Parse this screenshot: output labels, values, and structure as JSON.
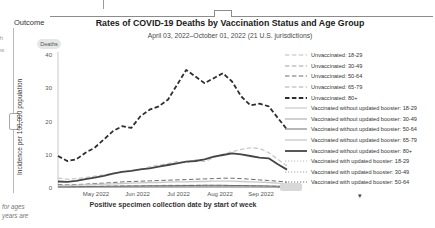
{
  "sidebar": {
    "outcome_label": "Outcome",
    "outcome_value": "Deaths",
    "edge_fragments": [
      "th",
      "ns"
    ]
  },
  "footer_fragments": [
    "for ages",
    "years are"
  ],
  "legend": {
    "more_icon": "▾"
  },
  "chart_data": {
    "type": "line",
    "title": "Rates of COVID-19 Deaths by Vaccination Status and Age Group",
    "subtitle": "April 03, 2022–October 01, 2022 (21 U.S. jurisdictions)",
    "xlabel": "Positive specimen collection date by start of week",
    "ylabel": "Incidence per 100,000 population",
    "ylim": [
      0,
      40
    ],
    "grid": false,
    "legend_position": "right",
    "y_ticks": [
      0,
      10,
      20,
      30,
      40
    ],
    "x_ticks": [
      "May 2022",
      "Jun 2022",
      "Jul 2022",
      "Aug 2022",
      "Sep 2022"
    ],
    "x": [
      "Apr 03",
      "Apr 10",
      "Apr 17",
      "Apr 24",
      "May 01",
      "May 08",
      "May 15",
      "May 22",
      "May 29",
      "Jun 05",
      "Jun 12",
      "Jun 19",
      "Jun 26",
      "Jul 03",
      "Jul 10",
      "Jul 17",
      "Jul 24",
      "Jul 31",
      "Aug 07",
      "Aug 14",
      "Aug 21",
      "Aug 28",
      "Sep 04",
      "Sep 11",
      "Sep 18",
      "Sep 25"
    ],
    "series": [
      {
        "name": "Unvaccinated: 18-29",
        "dash": "dashed",
        "color": "#bdbdbd",
        "width": 1,
        "values": [
          0.15,
          0.15,
          0.15,
          0.15,
          0.2,
          0.2,
          0.2,
          0.2,
          0.2,
          0.25,
          0.25,
          0.25,
          0.25,
          0.25,
          0.3,
          0.3,
          0.3,
          0.3,
          0.3,
          0.25,
          0.25,
          0.25,
          0.2,
          0.2,
          0.15,
          0.15
        ]
      },
      {
        "name": "Unvaccinated: 30-49",
        "dash": "dashed",
        "color": "#a1a1a1",
        "width": 1,
        "values": [
          0.3,
          0.3,
          0.3,
          0.35,
          0.4,
          0.4,
          0.45,
          0.5,
          0.5,
          0.55,
          0.6,
          0.6,
          0.65,
          0.65,
          0.65,
          0.7,
          0.7,
          0.65,
          0.65,
          0.6,
          0.6,
          0.55,
          0.5,
          0.45,
          0.4,
          0.35
        ]
      },
      {
        "name": "Unvaccinated: 50-64",
        "dash": "dashed",
        "color": "#6e6e6e",
        "width": 1,
        "values": [
          0.9,
          0.8,
          0.9,
          1.0,
          1.2,
          1.3,
          1.5,
          1.7,
          1.8,
          1.9,
          2.0,
          2.1,
          2.2,
          2.3,
          2.4,
          2.5,
          2.6,
          2.7,
          2.8,
          2.8,
          2.7,
          2.5,
          2.3,
          2.1,
          1.9,
          1.6
        ]
      },
      {
        "name": "Unvaccinated: 65-79",
        "dash": "dashed",
        "color": "#c8c8c8",
        "width": 1.3,
        "values": [
          2.8,
          2.5,
          2.7,
          3.0,
          3.4,
          3.8,
          4.3,
          4.8,
          5.0,
          5.5,
          6.2,
          6.8,
          7.2,
          7.8,
          7.5,
          8.3,
          7.8,
          9.0,
          10.0,
          10.8,
          11.5,
          12.0,
          11.8,
          10.5,
          8.5,
          6.5
        ]
      },
      {
        "name": "Unvaccinated: 80+",
        "dash": "dashed",
        "color": "#2e2e2e",
        "width": 1.8,
        "values": [
          9.5,
          8.0,
          8.5,
          10.5,
          12.0,
          14.5,
          17.0,
          18.5,
          18.0,
          21.5,
          23.5,
          24.5,
          26.5,
          31.0,
          35.5,
          33.5,
          31.5,
          33.0,
          34.5,
          32.0,
          27.5,
          24.8,
          25.3,
          24.5,
          21.0,
          17.5
        ]
      },
      {
        "name": "Vaccinated without updated booster: 18-29",
        "dash": "solid",
        "color": "#bdbdbd",
        "width": 1,
        "values": [
          0.05,
          0.05,
          0.05,
          0.05,
          0.05,
          0.1,
          0.1,
          0.1,
          0.1,
          0.1,
          0.1,
          0.1,
          0.1,
          0.1,
          0.1,
          0.1,
          0.1,
          0.1,
          0.1,
          0.1,
          0.1,
          0.1,
          0.1,
          0.05,
          0.05,
          0.05
        ]
      },
      {
        "name": "Vaccinated without updated booster: 30-49",
        "dash": "solid",
        "color": "#a1a1a1",
        "width": 1,
        "values": [
          0.1,
          0.1,
          0.1,
          0.1,
          0.15,
          0.15,
          0.15,
          0.2,
          0.2,
          0.2,
          0.2,
          0.25,
          0.25,
          0.25,
          0.25,
          0.25,
          0.25,
          0.25,
          0.25,
          0.25,
          0.2,
          0.2,
          0.2,
          0.15,
          0.15,
          0.1
        ]
      },
      {
        "name": "Vaccinated without updated booster: 50-64",
        "dash": "solid",
        "color": "#6e6e6e",
        "width": 1,
        "values": [
          0.2,
          0.2,
          0.25,
          0.3,
          0.3,
          0.35,
          0.4,
          0.4,
          0.45,
          0.45,
          0.5,
          0.5,
          0.55,
          0.55,
          0.6,
          0.6,
          0.65,
          0.65,
          0.65,
          0.6,
          0.6,
          0.55,
          0.5,
          0.45,
          0.4,
          0.3
        ]
      },
      {
        "name": "Vaccinated without updated booster: 65-79",
        "dash": "solid",
        "color": "#c8c8c8",
        "width": 1.3,
        "values": [
          0.6,
          0.6,
          0.7,
          0.8,
          0.9,
          1.0,
          1.1,
          1.2,
          1.3,
          1.4,
          1.5,
          1.5,
          1.6,
          1.7,
          1.7,
          1.8,
          1.8,
          1.9,
          1.9,
          1.9,
          1.8,
          1.7,
          1.6,
          1.5,
          1.3,
          1.1
        ]
      },
      {
        "name": "Vaccinated without updated booster: 80+",
        "dash": "solid",
        "color": "#454545",
        "width": 1.8,
        "values": [
          1.8,
          1.7,
          2.0,
          2.5,
          3.0,
          3.5,
          4.2,
          4.7,
          5.0,
          5.5,
          5.8,
          6.3,
          6.8,
          7.3,
          7.8,
          8.0,
          8.5,
          9.3,
          9.8,
          10.3,
          10.0,
          9.5,
          9.0,
          8.8,
          7.0,
          5.4
        ]
      },
      {
        "name": "Vaccinated with updated booster: 18-29",
        "dash": "dotted",
        "color": "#bdbdbd",
        "width": 1,
        "values": [
          null,
          null,
          null,
          null,
          null,
          null,
          null,
          null,
          null,
          null,
          null,
          null,
          null,
          null,
          null,
          null,
          null,
          null,
          null,
          null,
          null,
          null,
          null,
          null,
          0.05,
          0.05
        ]
      },
      {
        "name": "Vaccinated with updated booster: 30-49",
        "dash": "dotted",
        "color": "#a1a1a1",
        "width": 1,
        "values": [
          null,
          null,
          null,
          null,
          null,
          null,
          null,
          null,
          null,
          null,
          null,
          null,
          null,
          null,
          null,
          null,
          null,
          null,
          null,
          null,
          null,
          null,
          null,
          null,
          0.05,
          0.1
        ]
      },
      {
        "name": "Vaccinated with updated booster: 50-64",
        "dash": "dotted",
        "color": "#6e6e6e",
        "width": 1,
        "values": [
          null,
          null,
          null,
          null,
          null,
          null,
          null,
          null,
          null,
          null,
          null,
          null,
          null,
          null,
          null,
          null,
          null,
          null,
          null,
          null,
          null,
          null,
          null,
          null,
          0.1,
          0.15
        ]
      }
    ]
  }
}
